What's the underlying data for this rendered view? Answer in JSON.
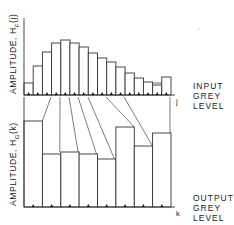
{
  "top_chart": {
    "ylabel_text": "AMPLITUDE,  H",
    "ylabel_sub": "F",
    "ylabel_arg": "(j)",
    "axis_var": "j",
    "side_label": [
      "INPUT",
      "GREY",
      "LEVEL"
    ]
  },
  "bottom_chart": {
    "ylabel_text": "AMPLITUDE,  H",
    "ylabel_sub": "G",
    "ylabel_arg": "(k)",
    "axis_var": "k",
    "side_label": [
      "OUTPUT",
      "GREY",
      "LEVEL"
    ]
  },
  "chart_data": [
    {
      "type": "bar",
      "title": "Input histogram",
      "xlabel": "INPUT GREY LEVEL (j)",
      "ylabel": "AMPLITUDE, H_F(j)",
      "categories": [
        0,
        1,
        2,
        3,
        4,
        5,
        6,
        7,
        8,
        9,
        10,
        11,
        12,
        13,
        14,
        15
      ],
      "values": [
        12,
        29,
        43,
        52,
        55,
        52,
        48,
        42,
        37,
        33,
        28,
        22,
        17,
        13,
        10,
        18
      ],
      "grid": false
    },
    {
      "type": "bar",
      "title": "Output histogram",
      "xlabel": "OUTPUT GREY LEVEL (k)",
      "ylabel": "AMPLITUDE, H_G(k)",
      "categories": [
        0,
        1,
        2,
        3,
        4,
        5,
        6,
        7
      ],
      "values": [
        86,
        53,
        55,
        53,
        48,
        80,
        61,
        74
      ],
      "grid": false
    }
  ],
  "mapping": {
    "description": "Lines map input grey level boundaries to output bar top-left corners",
    "segments": [
      {
        "from_input_x": 51,
        "to_output_bar": 1
      },
      {
        "from_input_x": 60,
        "to_output_bar": 2
      },
      {
        "from_input_x": 69,
        "to_output_bar": 2
      },
      {
        "from_input_x": 78,
        "to_output_bar": 3
      },
      {
        "from_input_x": 88,
        "to_output_bar": 4
      },
      {
        "from_input_x": 106,
        "to_output_bar": 5
      },
      {
        "from_input_x": 124,
        "to_output_bar": 6
      },
      {
        "from_input_x": 142,
        "to_output_bar": 7
      }
    ]
  }
}
